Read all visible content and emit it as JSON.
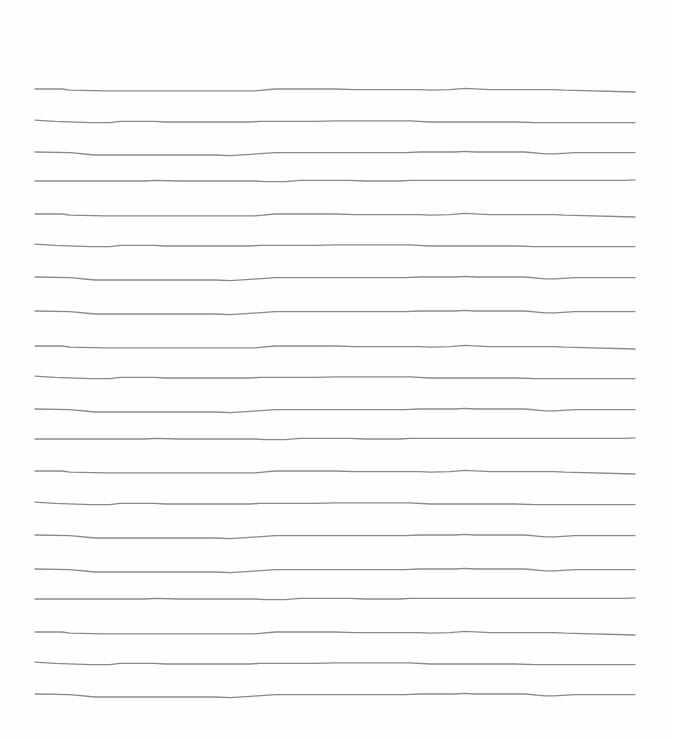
{
  "page": {
    "type": "ruled-sheet",
    "background": "#fefefe",
    "line_color": "#8a8a8a",
    "line_width": 1.3,
    "x_start": 35,
    "x_end": 635
  },
  "lines": [
    {
      "y": 89,
      "pattern": "a"
    },
    {
      "y": 122,
      "pattern": "b"
    },
    {
      "y": 152,
      "pattern": "c"
    },
    {
      "y": 181,
      "pattern": "d"
    },
    {
      "y": 214,
      "pattern": "a"
    },
    {
      "y": 246,
      "pattern": "b"
    },
    {
      "y": 277,
      "pattern": "c"
    },
    {
      "y": 311,
      "pattern": "c"
    },
    {
      "y": 346,
      "pattern": "a"
    },
    {
      "y": 378,
      "pattern": "b"
    },
    {
      "y": 409,
      "pattern": "c"
    },
    {
      "y": 439,
      "pattern": "d"
    },
    {
      "y": 471,
      "pattern": "a"
    },
    {
      "y": 504,
      "pattern": "b"
    },
    {
      "y": 535,
      "pattern": "c"
    },
    {
      "y": 569,
      "pattern": "c"
    },
    {
      "y": 599,
      "pattern": "d"
    },
    {
      "y": 632,
      "pattern": "a"
    },
    {
      "y": 664,
      "pattern": "b"
    },
    {
      "y": 694,
      "pattern": "c"
    }
  ],
  "patterns": {
    "a": [
      [
        0,
        0
      ],
      [
        27,
        0
      ],
      [
        35,
        2
      ],
      [
        70,
        3
      ],
      [
        220,
        3
      ],
      [
        240,
        0
      ],
      [
        300,
        0
      ],
      [
        320,
        1
      ],
      [
        385,
        1
      ],
      [
        395,
        2
      ],
      [
        415,
        1
      ],
      [
        430,
        -1
      ],
      [
        455,
        1
      ],
      [
        520,
        1
      ],
      [
        530,
        2
      ],
      [
        600,
        5
      ]
    ],
    "b": [
      [
        0,
        -3
      ],
      [
        20,
        -1
      ],
      [
        55,
        1
      ],
      [
        75,
        1
      ],
      [
        85,
        -1
      ],
      [
        120,
        -1
      ],
      [
        130,
        0
      ],
      [
        215,
        0
      ],
      [
        225,
        -1
      ],
      [
        280,
        -1
      ],
      [
        300,
        -2
      ],
      [
        375,
        -2
      ],
      [
        395,
        0
      ],
      [
        480,
        0
      ],
      [
        500,
        1
      ],
      [
        600,
        1
      ]
    ],
    "c": [
      [
        0,
        0
      ],
      [
        35,
        1
      ],
      [
        60,
        5
      ],
      [
        180,
        5
      ],
      [
        195,
        6
      ],
      [
        215,
        4
      ],
      [
        240,
        1
      ],
      [
        370,
        1
      ],
      [
        385,
        0
      ],
      [
        420,
        0
      ],
      [
        430,
        -1
      ],
      [
        440,
        0
      ],
      [
        490,
        0
      ],
      [
        510,
        3
      ],
      [
        520,
        3
      ],
      [
        540,
        1
      ],
      [
        600,
        1
      ]
    ],
    "d": [
      [
        0,
        0
      ],
      [
        110,
        0
      ],
      [
        120,
        -1
      ],
      [
        145,
        0
      ],
      [
        220,
        0
      ],
      [
        230,
        1
      ],
      [
        250,
        1
      ],
      [
        265,
        -1
      ],
      [
        315,
        -1
      ],
      [
        330,
        0
      ],
      [
        365,
        0
      ],
      [
        375,
        -1
      ],
      [
        440,
        -1
      ],
      [
        590,
        -1
      ],
      [
        600,
        -2
      ]
    ]
  }
}
